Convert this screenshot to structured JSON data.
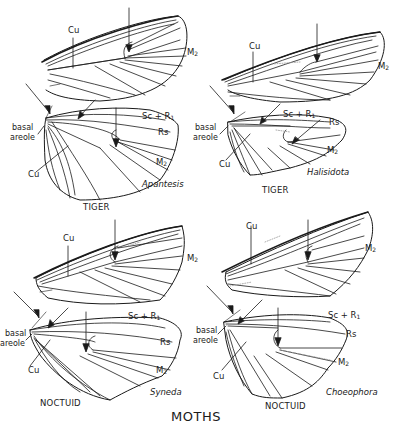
{
  "figure": {
    "title": "MOTHS",
    "background": "#ffffff",
    "line_color": "#1a1a1a",
    "panels": [
      {
        "id": "top-left",
        "family": "TIGER",
        "genus": "Apantesis",
        "labels": {
          "cu_forewing": "Cu",
          "m2_forewing": "M",
          "m2_forewing_sub": "2",
          "sc_r1": "Sc + R",
          "sc_r1_sub": "1",
          "rs": "Rs",
          "m2_hindwing": "M",
          "m2_hindwing_sub": "2",
          "basal": "basal",
          "areole": "areole",
          "cu_hindwing": "Cu"
        }
      },
      {
        "id": "top-right",
        "family": "TIGER",
        "genus": "Halisidota",
        "labels": {
          "cu_forewing": "Cu",
          "m2_forewing": "M",
          "m2_forewing_sub": "2",
          "sc_r1": "Sc + R",
          "sc_r1_sub": "1",
          "rs": "Rs",
          "m2_hindwing": "M",
          "m2_hindwing_sub": "2",
          "basal": "basal",
          "areole": "areole",
          "cu_hindwing": "Cu"
        }
      },
      {
        "id": "bottom-left",
        "family": "NOCTUID",
        "genus": "Syneda",
        "labels": {
          "cu_forewing": "Cu",
          "m2_forewing": "M",
          "m2_forewing_sub": "2",
          "sc_r1": "Sc + R",
          "sc_r1_sub": "1",
          "rs": "Rs",
          "m2_hindwing": "M",
          "m2_hindwing_sub": "2",
          "basal": "basal",
          "areole": "areole",
          "cu_hindwing": "Cu"
        }
      },
      {
        "id": "bottom-right",
        "family": "NOCTUID",
        "genus": "Choeophora",
        "labels": {
          "cu_forewing": "Cu",
          "m2_forewing": "M",
          "m2_forewing_sub": "2",
          "sc_r1": "Sc + R",
          "sc_r1_sub": "1",
          "rs": "Rs",
          "m2_hindwing": "M",
          "m2_hindwing_sub": "2",
          "basal": "basal",
          "areole": "areole",
          "cu_hindwing": "Cu"
        }
      }
    ]
  }
}
